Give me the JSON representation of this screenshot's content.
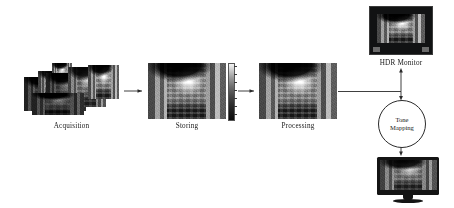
{
  "diagram": {
    "background_color": "#ffffff",
    "line_color": "#2a2a2a"
  },
  "stages": [
    {
      "id": "acquisition",
      "label": "Acquisition",
      "description": "Stack of overlapping bracketed exposure photographs of a street scene"
    },
    {
      "id": "storing",
      "label": "Storing",
      "description": "High dynamic range radiance map of a street scene with luminance colorbar"
    },
    {
      "id": "processing",
      "label": "Processing",
      "description": "Processed high dynamic range street scene image"
    }
  ],
  "nodes": [
    {
      "id": "tone-mapping",
      "label_line1": "Tone",
      "label_line2": "Mapping",
      "shape": "circle"
    }
  ],
  "outputs": [
    {
      "id": "hdr-monitor",
      "label": "HDR Monitor",
      "description": "HDR display showing the bright street scene"
    },
    {
      "id": "sdr-monitor",
      "label": "",
      "description": "Standard LCD monitor showing the tone mapped street scene"
    }
  ],
  "colorbar": {
    "id": "storing-colorbar",
    "orientation": "vertical",
    "gradient_top": "#f4f4f4",
    "gradient_bottom": "#0b0b0b",
    "ticks": [
      "",
      "",
      "",
      "",
      "",
      "",
      ""
    ]
  },
  "connectors": [
    {
      "id": "acquisition-to-storing",
      "kind": "arrow",
      "direction": "right"
    },
    {
      "id": "storing-to-processing",
      "kind": "arrow",
      "direction": "right"
    },
    {
      "id": "processing-to-branch",
      "kind": "line",
      "direction": "right"
    },
    {
      "id": "branch-to-hdr-monitor",
      "kind": "arrow",
      "direction": "up"
    },
    {
      "id": "branch-to-tone-mapping",
      "kind": "arrow",
      "direction": "down"
    },
    {
      "id": "tone-mapping-to-sdr-monitor",
      "kind": "arrow",
      "direction": "down"
    }
  ]
}
